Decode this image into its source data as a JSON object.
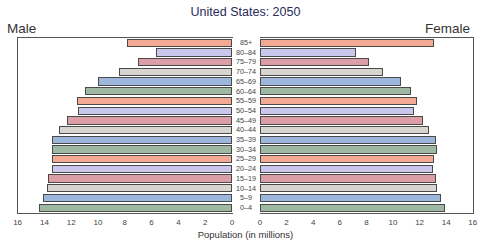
{
  "chart_data": {
    "type": "bar",
    "subtype": "population-pyramid",
    "title": "United States: 2050",
    "xlabel": "Population (in millions)",
    "ylabel": "",
    "left_label": "Male",
    "right_label": "Female",
    "categories": [
      "85+",
      "80–84",
      "75–79",
      "70–74",
      "65–69",
      "60–64",
      "55–59",
      "50–54",
      "45–49",
      "40–44",
      "35–39",
      "30–34",
      "25–29",
      "20–24",
      "15–19",
      "10–14",
      "5–9",
      "0–4"
    ],
    "series": [
      {
        "name": "Male",
        "values": [
          7.8,
          5.7,
          7.0,
          8.4,
          10.0,
          11.0,
          11.6,
          11.5,
          12.3,
          12.9,
          13.4,
          13.4,
          13.4,
          13.4,
          13.7,
          13.8,
          14.1,
          14.4
        ]
      },
      {
        "name": "Female",
        "values": [
          13.0,
          7.2,
          8.1,
          9.2,
          10.5,
          11.3,
          11.7,
          11.5,
          12.2,
          12.6,
          13.1,
          13.2,
          13.0,
          12.9,
          13.1,
          13.2,
          13.5,
          13.8
        ]
      }
    ],
    "xlim": [
      0,
      16
    ],
    "male_ticks": [
      "16",
      "14",
      "12",
      "10",
      "8",
      "6",
      "4",
      "2",
      "0"
    ],
    "female_ticks": [
      "0",
      "2",
      "4",
      "6",
      "8",
      "10",
      "12",
      "14",
      "16"
    ],
    "bar_colors": [
      "#f2aa94",
      "#c9c8ec",
      "#dc9ea6",
      "#d8d4cf",
      "#9cb6dc",
      "#9fb8a2"
    ],
    "grid": false,
    "legend": "none"
  }
}
